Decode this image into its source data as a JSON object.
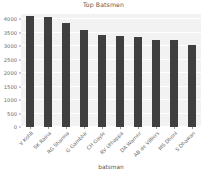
{
  "chart_data": {
    "type": "bar",
    "title": "Top Batsmen",
    "xlabel": "batsman",
    "ylabel": "",
    "categories": [
      "V Kohli",
      "SK Raina",
      "RG Sharma",
      "G Gambhir",
      "CH Gayle",
      "RV Uthappa",
      "DA Warner",
      "AB de Villiers",
      "MS Dhoni",
      "S Dhawan"
    ],
    "values": [
      4110,
      4100,
      3870,
      3600,
      3430,
      3370,
      3340,
      3240,
      3240,
      3060
    ],
    "ylim": [
      0,
      4200
    ],
    "yticks": [
      0,
      500,
      1000,
      1500,
      2000,
      2500,
      3000,
      3500,
      4000
    ],
    "ytick_labels": [
      "0",
      "500",
      "1000",
      "1500",
      "2000",
      "2500",
      "3000",
      "3500",
      "4000"
    ],
    "grid": true,
    "legend": false,
    "bar_color": "#3f3f3f",
    "plot_background": "#f2f2f2"
  }
}
